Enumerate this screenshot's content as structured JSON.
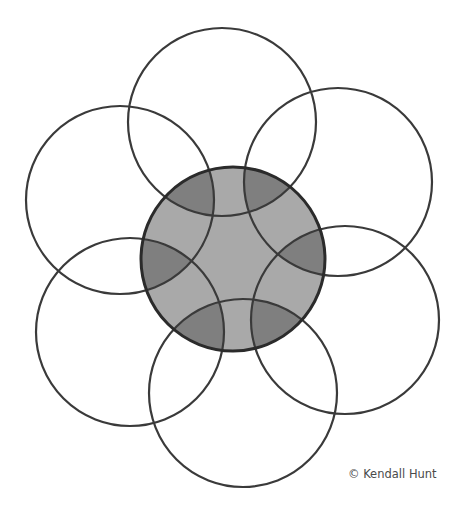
{
  "diagram": {
    "type": "overlapping-circles",
    "center_circle": {
      "cx": 233,
      "cy": 259,
      "r": 92,
      "fill": "#a9a9a9",
      "stroke": "#2b2b2b"
    },
    "outer_circles": [
      {
        "name": "top",
        "cx": 222,
        "cy": 122,
        "r": 94
      },
      {
        "name": "upper-right",
        "cx": 338,
        "cy": 182,
        "r": 94
      },
      {
        "name": "lower-right",
        "cx": 345,
        "cy": 320,
        "r": 94
      },
      {
        "name": "bottom",
        "cx": 243,
        "cy": 393,
        "r": 94
      },
      {
        "name": "lower-left",
        "cx": 130,
        "cy": 332,
        "r": 94
      },
      {
        "name": "upper-left",
        "cx": 120,
        "cy": 200,
        "r": 94
      }
    ],
    "overlap_fill": "#7f7f7f",
    "stroke_color": "#3a3a3a"
  },
  "credit": "© Kendall Hunt"
}
